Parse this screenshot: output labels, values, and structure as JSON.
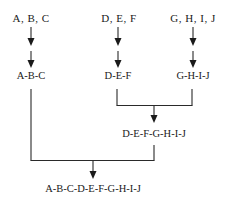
{
  "diagram": {
    "type": "merge-tree",
    "inputs": [
      {
        "id": "group-abc",
        "label": "A, B, C"
      },
      {
        "id": "group-def",
        "label": "D, E, F"
      },
      {
        "id": "group-ghij",
        "label": "G, H, I, J"
      }
    ],
    "stage1": [
      {
        "id": "merged-abc",
        "label": "A-B-C",
        "from": [
          "group-abc"
        ]
      },
      {
        "id": "merged-def",
        "label": "D-E-F",
        "from": [
          "group-def"
        ]
      },
      {
        "id": "merged-ghij",
        "label": "G-H-I-J",
        "from": [
          "group-ghij"
        ]
      }
    ],
    "stage2": [
      {
        "id": "merged-defghij",
        "label": "D-E-F-G-H-I-J",
        "from": [
          "merged-def",
          "merged-ghij"
        ]
      }
    ],
    "final": {
      "id": "merged-all",
      "label": "A-B-C-D-E-F-G-H-I-J",
      "from": [
        "merged-abc",
        "merged-defghij"
      ]
    },
    "colors": {
      "line": "#2a2a2a",
      "text": "#1a1a1a",
      "background": "#ffffff"
    }
  }
}
